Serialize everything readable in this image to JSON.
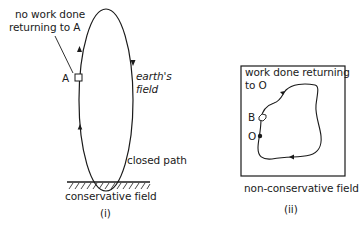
{
  "panel_i": {
    "annotation": [
      "no work done",
      "returning to A"
    ],
    "point_label": "A",
    "field_label": [
      "earth's",
      "field"
    ],
    "path_label": "closed path",
    "caption": "conservative field",
    "numeral": "(i)"
  },
  "panel_ii": {
    "annotation": [
      "work done returning",
      "to O"
    ],
    "point_B": "B",
    "point_O": "O",
    "caption": "non-conservative field",
    "numeral": "(ii)"
  },
  "colors": {
    "ink": "#1a1a1a",
    "background": "#ffffff"
  }
}
